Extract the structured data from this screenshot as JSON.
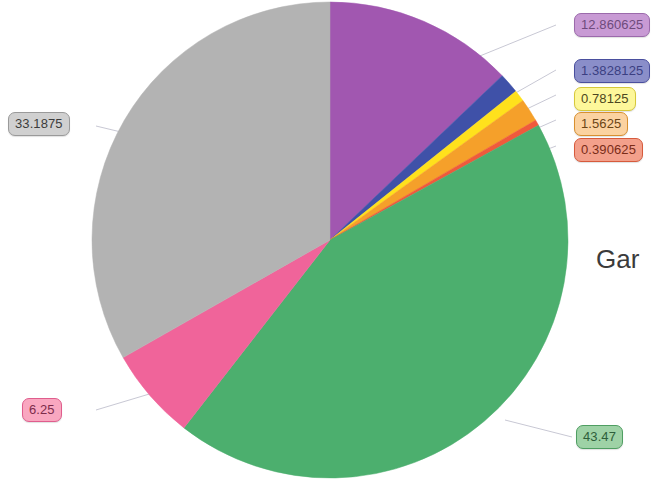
{
  "chart_data": {
    "type": "pie",
    "title": "",
    "legend_title_visible": "Gar",
    "legend_position": "right",
    "grid": false,
    "total": 99.8854375,
    "start_angle_deg": 0,
    "direction": "clockwise",
    "categories": [
      "purple-slice",
      "blue-slice",
      "yellow-slice",
      "orange-slice",
      "red-slice",
      "green-slice",
      "pink-slice",
      "gray-slice"
    ],
    "values": [
      12.860625,
      1.3828125,
      0.78125,
      1.5625,
      0.390625,
      43.47,
      6.25,
      33.1875
    ],
    "labels": [
      "12.860625",
      "1.3828125",
      "0.78125",
      "1.5625",
      "0.390625",
      "43.47",
      "6.25",
      "33.1875"
    ],
    "colors": [
      "#a157b0",
      "#3f51a8",
      "#ffe11c",
      "#f5a02a",
      "#ef5a3c",
      "#4caf6e",
      "#f0649a",
      "#b3b3b3"
    ]
  },
  "slices": [
    {
      "name": "purple-slice",
      "label": "12.860625",
      "value": 12.860625,
      "color": "#a157b0"
    },
    {
      "name": "blue-slice",
      "label": "1.3828125",
      "value": 1.3828125,
      "color": "#3f51a8"
    },
    {
      "name": "yellow-slice",
      "label": "0.78125",
      "value": 0.78125,
      "color": "#ffe11c"
    },
    {
      "name": "orange-slice",
      "label": "1.5625",
      "value": 1.5625,
      "color": "#f5a02a"
    },
    {
      "name": "red-slice",
      "label": "0.390625",
      "value": 0.390625,
      "color": "#ef5a3c"
    },
    {
      "name": "green-slice",
      "label": "43.47",
      "value": 43.47,
      "color": "#4caf6e"
    },
    {
      "name": "pink-slice",
      "label": "6.25",
      "value": 6.25,
      "color": "#f0649a"
    },
    {
      "name": "gray-slice",
      "label": "33.1875",
      "value": 33.1875,
      "color": "#b3b3b3"
    }
  ],
  "callouts": {
    "purple": "12.860625",
    "blue": "1.3828125",
    "yellow": "0.78125",
    "orange": "1.5625",
    "red": "0.390625",
    "gray": "33.1875",
    "pink": "6.25",
    "green": "43.47"
  },
  "legend": {
    "title": "Gar"
  }
}
